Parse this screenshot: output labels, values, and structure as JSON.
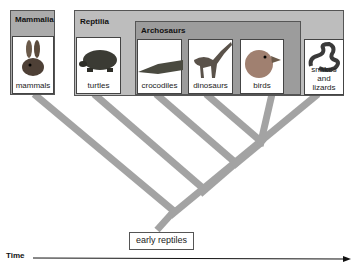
{
  "groups": {
    "mammalia": {
      "label": "Mammalia"
    },
    "reptilia": {
      "label": "Reptilia"
    },
    "archosaurs": {
      "label": "Archosaurs"
    }
  },
  "taxa": [
    {
      "label": "mammals",
      "icon": "rabbit-icon"
    },
    {
      "label": "turtles",
      "icon": "turtle-icon"
    },
    {
      "label": "crocodiles",
      "icon": "crocodile-icon"
    },
    {
      "label": "dinosaurs",
      "icon": "dinosaur-icon"
    },
    {
      "label": "birds",
      "icon": "bird-icon"
    },
    {
      "label": "snakes and lizards",
      "line1": "snakes",
      "line2": "and lizards",
      "icon": "snake-icon"
    }
  ],
  "root": {
    "label": "early reptiles"
  },
  "axis": {
    "label": "Time"
  },
  "colors": {
    "branch": "#a3a3a3",
    "group_reptilia": "#bdbdbd",
    "group_archosaurs": "#9c9c9c",
    "group_mammalia": "#ababab",
    "card_bg": "#ffffff"
  }
}
